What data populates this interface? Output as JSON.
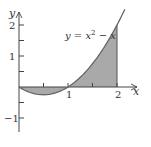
{
  "chart_data": {
    "type": "line",
    "title": "",
    "xlabel": "x",
    "ylabel": "y",
    "xlim": [
      0,
      2.3
    ],
    "ylim": [
      -1.5,
      2.6
    ],
    "x_ticks": [
      0.5,
      1,
      1.5,
      2
    ],
    "x_tick_labels": [
      "",
      "1",
      "",
      "2"
    ],
    "y_ticks": [
      -1,
      -0.5,
      0.5,
      1,
      1.5,
      2
    ],
    "y_tick_labels": [
      "−1",
      "",
      "",
      "1",
      "",
      "2"
    ],
    "grid": false,
    "series": [
      {
        "name": "y = x² − x",
        "function": "x^2 - x",
        "x": [
          0,
          0.25,
          0.5,
          0.75,
          1,
          1.25,
          1.5,
          1.75,
          2,
          2.16
        ],
        "y": [
          0,
          -0.1875,
          -0.25,
          -0.1875,
          0,
          0.3125,
          0.75,
          1.3125,
          2,
          2.51
        ]
      }
    ],
    "shaded_region": {
      "from_x": 0,
      "to_x": 2,
      "between": "curve and x-axis",
      "color": "#a9a9a9"
    },
    "annotations": [
      {
        "text": "y = x² − x",
        "position": "upper middle, left of curve"
      }
    ]
  },
  "labels": {
    "y_axis": "y",
    "x_axis": "x",
    "tick_1x": "1",
    "tick_2x": "2",
    "tick_1y": "1",
    "tick_2y": "2",
    "tick_neg1y": "−1",
    "curve_eq_pre": "y = x",
    "curve_eq_sup": "2",
    "curve_eq_post": " − x"
  },
  "colors": {
    "axis": "#444444",
    "curve": "#666666",
    "fill": "#a9a9a9",
    "text": "#333333"
  }
}
